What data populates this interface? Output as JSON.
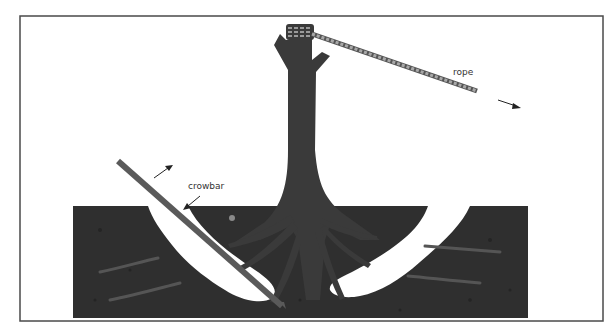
{
  "diagram": {
    "labels": {
      "rope": "rope",
      "crowbar": "crowbar"
    },
    "colors": {
      "frame": "#4a4a4a",
      "soil": "#2f2f2f",
      "trunk": "#3a3a3a",
      "rope": "#8a8a8a",
      "crowbar": "#5a5a5a",
      "background": "#ffffff",
      "hole": "#ffffff"
    },
    "arrows": [
      {
        "name": "rope-pull-direction",
        "direction": "down-right"
      },
      {
        "name": "crowbar-lever-up",
        "direction": "up-right"
      },
      {
        "name": "crowbar-push-down",
        "direction": "down-left"
      }
    ]
  }
}
